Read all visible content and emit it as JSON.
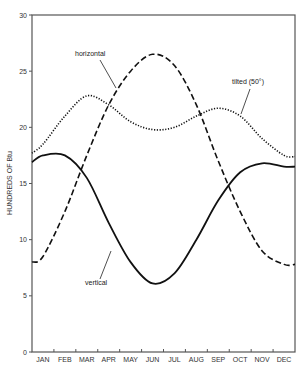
{
  "chart_data": {
    "type": "line",
    "title": "",
    "xlabel": "",
    "ylabel": "HUNDREDS OF Btu",
    "ylim": [
      0,
      30
    ],
    "yticks": [
      0,
      5,
      10,
      15,
      20,
      25,
      30
    ],
    "grid": false,
    "legend": "inline annotations",
    "categories": [
      "JAN",
      "FEB",
      "MAR",
      "APR",
      "MAY",
      "JUN",
      "JUL",
      "AUG",
      "SEP",
      "OCT",
      "NOV",
      "DEC"
    ],
    "series": [
      {
        "name": "horizontal",
        "style": "dashed",
        "values": [
          8.5,
          12.5,
          17.5,
          22.0,
          25.0,
          26.5,
          25.5,
          22.0,
          17.0,
          12.5,
          9.0,
          7.8
        ]
      },
      {
        "name": "tilted (50°)",
        "style": "dotted",
        "values": [
          18.5,
          21.0,
          22.8,
          22.0,
          20.5,
          19.8,
          20.0,
          21.0,
          21.7,
          21.0,
          19.0,
          17.5
        ]
      },
      {
        "name": "vertical",
        "style": "solid",
        "values": [
          17.5,
          17.5,
          15.5,
          11.5,
          8.0,
          6.1,
          7.0,
          10.0,
          13.5,
          16.0,
          16.8,
          16.5
        ]
      }
    ],
    "annotations": [
      {
        "text": "horizontal"
      },
      {
        "text": "tilted (50°)"
      },
      {
        "text": "vertical"
      }
    ]
  }
}
